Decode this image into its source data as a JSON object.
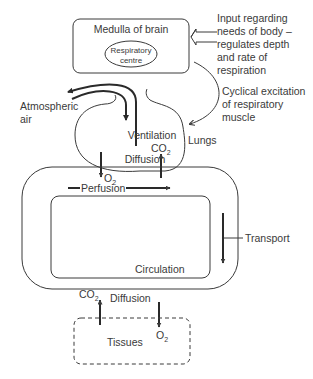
{
  "diagram": {
    "medulla": {
      "title": "Medulla of brain",
      "centre_line1": "Respiratory",
      "centre_line2": "centre"
    },
    "input_note": {
      "lines": [
        "Input regarding",
        "needs of body –",
        "regulates depth",
        "and rate of",
        "respiration"
      ]
    },
    "excitation_note": {
      "lines": [
        "Cyclical excitation",
        "of respiratory",
        "muscle"
      ]
    },
    "atmospheric": {
      "line1": "Atmospheric",
      "line2": "air"
    },
    "lungs": {
      "ventilation": "Ventilation",
      "label": "Lungs",
      "diffusion": "Diffusion",
      "o2": "O",
      "o2_sub": "2",
      "co2": "CO",
      "co2_sub": "2"
    },
    "circulation": {
      "perfusion": "Perfusion",
      "transport": "Transport",
      "label": "Circulation"
    },
    "tissues": {
      "diffusion": "Diffusion",
      "label": "Tissues",
      "o2": "O",
      "o2_sub": "2",
      "co2": "CO",
      "co2_sub": "2"
    }
  }
}
